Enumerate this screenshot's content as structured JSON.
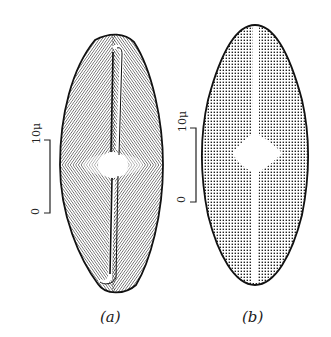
{
  "figure": {
    "panels": [
      {
        "id": "a",
        "label": "(a)",
        "texture": "radial striae lines",
        "scale_bar": {
          "top_label": "10μ",
          "bottom_label": "0"
        }
      },
      {
        "id": "b",
        "label": "(b)",
        "texture": "punctate dots",
        "scale_bar": {
          "top_label": "10μ",
          "bottom_label": "0"
        }
      }
    ],
    "colors": {
      "ink": "#1a1a1a",
      "paper": "#ffffff"
    }
  }
}
